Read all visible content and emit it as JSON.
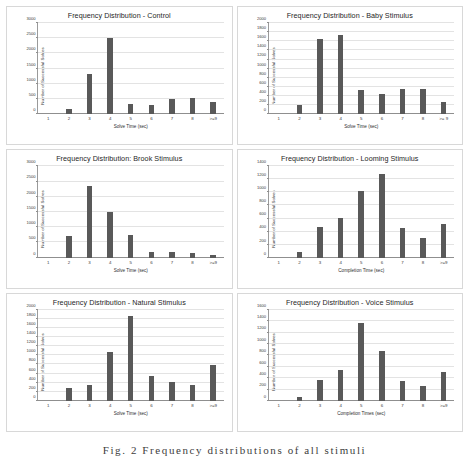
{
  "caption": "Fig. 2 Frequency distributions of all stimuli",
  "colors": {
    "bar": "#595959",
    "gridline": "#e3e3e3",
    "axis": "#8f8f8f",
    "panel_border": "#d8d8d8",
    "background": "#ffffff"
  },
  "chart_data": [
    {
      "type": "bar",
      "title": "Frequency Distribution - Control",
      "xlabel": "Solve Time (sec)",
      "ylabel": "Number  of Successful Solves",
      "categories": [
        "1",
        "2",
        "3",
        "4",
        "5",
        "6",
        "7",
        "8",
        ">=9"
      ],
      "values": [
        0,
        170,
        1330,
        2500,
        330,
        310,
        510,
        540,
        410
      ],
      "yticks": [
        0,
        500,
        1000,
        1500,
        2000,
        2500,
        3000
      ],
      "ylim": [
        0,
        3000
      ],
      "grid": true,
      "legend": false
    },
    {
      "type": "bar",
      "title": "Frequency Distribution - Baby Stimulus",
      "xlabel": "Solve Time (sec)",
      "ylabel": "Number of Successful Solves",
      "categories": [
        "1",
        "2",
        "3",
        "4",
        "5",
        "6",
        "7",
        "8",
        ">= 9"
      ],
      "values": [
        0,
        210,
        1660,
        1740,
        540,
        440,
        550,
        550,
        270
      ],
      "yticks": [
        0,
        200,
        400,
        600,
        800,
        1000,
        1200,
        1400,
        1600,
        1800,
        2000
      ],
      "ylim": [
        0,
        2000
      ],
      "grid": true,
      "legend": false
    },
    {
      "type": "bar",
      "title": "Frequency Distribution: Brook Stimulus",
      "xlabel": "Solve Time (sec)",
      "ylabel": "Number of Successful Solves",
      "categories": [
        "1",
        "2",
        "3",
        "4",
        "5",
        "6",
        "7",
        "8",
        ">=9"
      ],
      "values": [
        0,
        700,
        2370,
        1490,
        740,
        200,
        195,
        160,
        75
      ],
      "yticks": [
        0,
        500,
        1000,
        1500,
        2000,
        2500,
        3000
      ],
      "ylim": [
        0,
        3000
      ],
      "grid": true,
      "legend": false
    },
    {
      "type": "bar",
      "title": "Frequency Distribution - Looming Stimulus",
      "xlabel": "Completion Time (sec)",
      "ylabel": "Number  of Successful Solves",
      "categories": [
        "1",
        "2",
        "3",
        "4",
        "5",
        "6",
        "7",
        "8",
        ">=9"
      ],
      "values": [
        0,
        80,
        470,
        610,
        1020,
        1290,
        450,
        300,
        510
      ],
      "yticks": [
        0,
        200,
        400,
        600,
        800,
        1000,
        1200,
        1400
      ],
      "ylim": [
        0,
        1400
      ],
      "grid": true,
      "legend": false
    },
    {
      "type": "bar",
      "title": "Frequency Distribution - Natural Stimulus",
      "xlabel": "Solve Time (sec)",
      "ylabel": "Number  of Successful Solves",
      "categories": [
        "1",
        "2",
        "3",
        "4",
        "5",
        "6",
        "7",
        "8",
        ">=9"
      ],
      "values": [
        0,
        290,
        350,
        1080,
        1860,
        550,
        420,
        340,
        780
      ],
      "yticks": [
        0,
        200,
        400,
        600,
        800,
        1000,
        1200,
        1400,
        1600,
        1800,
        2000
      ],
      "ylim": [
        0,
        2000
      ],
      "grid": true,
      "legend": false
    },
    {
      "type": "bar",
      "title": "Frequency Distribution - Voice Stimulus",
      "xlabel": "Completion Times (sec)",
      "ylabel": "Number  of Successful Solves",
      "categories": [
        "1",
        "2",
        "3",
        "4",
        "5",
        "6",
        "7",
        "8",
        ">=9"
      ],
      "values": [
        0,
        65,
        370,
        540,
        1370,
        870,
        350,
        270,
        500
      ],
      "yticks": [
        0,
        200,
        400,
        600,
        800,
        1000,
        1200,
        1400,
        1600
      ],
      "ylim": [
        0,
        1600
      ],
      "grid": true,
      "legend": false
    }
  ]
}
